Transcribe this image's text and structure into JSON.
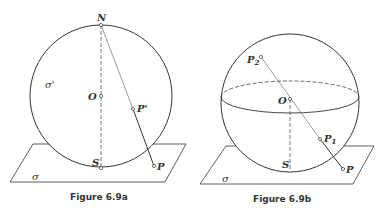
{
  "figure_a": {
    "caption": "Figure 6.9a",
    "labels": {
      "north": "N",
      "center": "O",
      "south": "S",
      "sphere": "σ'",
      "plane": "σ",
      "projected_point": "P'",
      "point": "P"
    }
  },
  "figure_b": {
    "caption": "Figure 6.9b",
    "labels": {
      "center": "O",
      "south": "S",
      "plane": "σ",
      "point_p1_base": "P",
      "point_p1_sub": "1",
      "point_p2_base": "P",
      "point_p2_sub": "2",
      "point": "P"
    }
  },
  "colors": {
    "stroke": "#333333",
    "background": "#ffffff"
  }
}
